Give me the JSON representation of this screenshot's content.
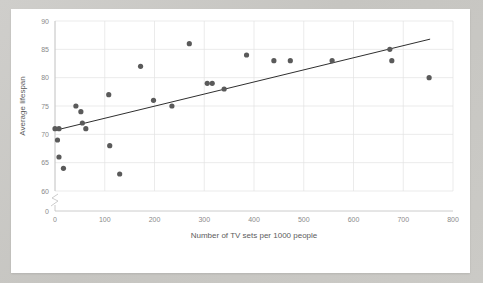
{
  "chart_data": {
    "type": "scatter",
    "title": "",
    "xlabel": "Number of TV sets per 1000 people",
    "ylabel": "Average lifespan",
    "xlim": [
      0,
      800
    ],
    "ylim": [
      60,
      90
    ],
    "y_axis_broken": true,
    "y_break_label": "0",
    "grid": true,
    "legend": "none",
    "xticks": [
      "0",
      "100",
      "200",
      "300",
      "400",
      "500",
      "600",
      "700",
      "800"
    ],
    "xtick_values": [
      0,
      100,
      200,
      300,
      400,
      500,
      600,
      700,
      800
    ],
    "yticks": [
      "60",
      "65",
      "70",
      "75",
      "80",
      "85",
      "90"
    ],
    "ytick_values": [
      60,
      65,
      70,
      75,
      80,
      85,
      90
    ],
    "point_color": "#5a5a5a",
    "trendline_color": "#2f2f2f",
    "grid_color": "#e2e2e2",
    "points": [
      {
        "x": 0,
        "y": 71
      },
      {
        "x": 8,
        "y": 71
      },
      {
        "x": 5,
        "y": 69
      },
      {
        "x": 8,
        "y": 66
      },
      {
        "x": 17,
        "y": 64
      },
      {
        "x": 42,
        "y": 75
      },
      {
        "x": 52,
        "y": 74
      },
      {
        "x": 55,
        "y": 72
      },
      {
        "x": 62,
        "y": 71
      },
      {
        "x": 108,
        "y": 77
      },
      {
        "x": 110,
        "y": 68
      },
      {
        "x": 130,
        "y": 63
      },
      {
        "x": 172,
        "y": 82
      },
      {
        "x": 198,
        "y": 76
      },
      {
        "x": 235,
        "y": 75
      },
      {
        "x": 270,
        "y": 86
      },
      {
        "x": 306,
        "y": 79
      },
      {
        "x": 316,
        "y": 79
      },
      {
        "x": 340,
        "y": 78
      },
      {
        "x": 385,
        "y": 84
      },
      {
        "x": 440,
        "y": 83
      },
      {
        "x": 473,
        "y": 83
      },
      {
        "x": 557,
        "y": 83
      },
      {
        "x": 673,
        "y": 85
      },
      {
        "x": 677,
        "y": 83
      },
      {
        "x": 752,
        "y": 80
      }
    ],
    "trendline": {
      "x0": 0,
      "y0": 70.7,
      "x1": 754,
      "y1": 86.8
    }
  }
}
